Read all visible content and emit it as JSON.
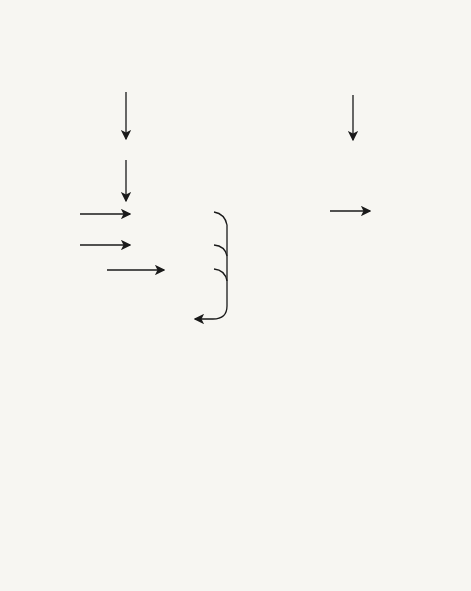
{
  "intrinsic": {
    "numeral": "I.",
    "title1": "INTRINSIC",
    "title2": "SYSTEM",
    "hageman": "HAGEMAN FACTOR (XII)",
    "contact": "CONTACT",
    "active_hageman": "ACTIVE HAGEMAN FACTOR",
    "pta": "PTA (XI)",
    "active_pta": "ACTIVE PTA",
    "ptc": "PTC (IX)",
    "active_ptc": "ACTIVE PTC",
    "ahf1": "ANTIHEMOPHILIC",
    "ahf2": "FACTOR (VIII)",
    "active_ahf1": "ACTIVE",
    "active_ahf2": "AHF",
    "ca": "Ca",
    "ca_sup": "++",
    "blood_convertin": "BLOOD CONVERTIN"
  },
  "extrinsic": {
    "numeral": "II.",
    "title1": "EXTRINSIC",
    "title2": "SYSTEM",
    "contact": "CONTACT",
    "factor7": "FACTOR VII",
    "active_f7_1": "ACTIVE",
    "active_f7_2": "FACTOR VII",
    "active_f7_3": "(PROCONVERTIN)",
    "tissue1": "TISSUE",
    "tissue2": "THROMBOPLASTIN",
    "ca": "Ca",
    "ca_sup": "++",
    "tissue_convertin": "TISSUE CONVERTIN"
  },
  "common": {
    "stuart1": "STUART",
    "stuart2": "FACTOR (X)",
    "active_stuart1": "ACTIVE",
    "active_stuart2": "STUART FACTOR",
    "proaccelerin": "PROACCELERIN (V)",
    "active_proacc1": "ACTIVE",
    "active_proacc2": "PROACCELERIN",
    "cephalin": "CEPHALIN",
    "prothrombinase": "PROTHROMBINASE",
    "prothrombin": "PROTHROMBIN (II)",
    "thrombin": "THROMBIN",
    "fibrinogen": "FIBRINOGEN (I)",
    "fibrin": "FIBRIN"
  }
}
